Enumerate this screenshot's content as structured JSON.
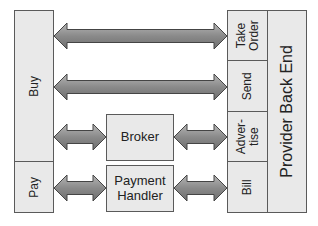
{
  "diagram": {
    "left": {
      "buy": "Buy",
      "pay": "Pay"
    },
    "middle": {
      "broker": "Broker",
      "payment_handler_line1": "Payment",
      "payment_handler_line2": "Handler"
    },
    "right": {
      "take_order_line1": "Take",
      "take_order_line2": "Order",
      "send": "Send",
      "advertise_line1": "Adver-",
      "advertise_line2": "tise",
      "bill": "Bill",
      "backend": "Provider Back End"
    },
    "arrows": [
      {
        "from": "Buy",
        "to": "Take Order",
        "direction": "bidirectional"
      },
      {
        "from": "Buy",
        "to": "Send",
        "direction": "bidirectional"
      },
      {
        "from": "Buy",
        "to": "Broker",
        "direction": "bidirectional"
      },
      {
        "from": "Broker",
        "to": "Advertise",
        "direction": "bidirectional"
      },
      {
        "from": "Pay",
        "to": "Payment Handler",
        "direction": "bidirectional"
      },
      {
        "from": "Payment Handler",
        "to": "Bill",
        "direction": "bidirectional"
      }
    ],
    "colors": {
      "box_fill": "#e9e9e9",
      "box_border": "#5a5a5a",
      "arrow_fill": "#8c8c8c",
      "arrow_stroke": "#444444"
    }
  }
}
